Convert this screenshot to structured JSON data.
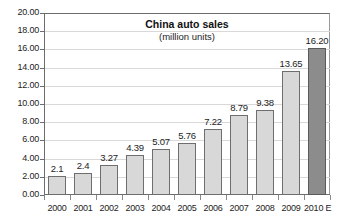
{
  "chart_data": {
    "type": "bar",
    "title": "China auto sales",
    "subtitle": "(million units)",
    "xlabel": "",
    "ylabel": "",
    "ylim": [
      0,
      20
    ],
    "grid": true,
    "legend": "none",
    "categories": [
      "2000",
      "2001",
      "2002",
      "2003",
      "2004",
      "2005",
      "2006",
      "2007",
      "2008",
      "2009",
      "2010 E"
    ],
    "values": [
      2.1,
      2.4,
      3.27,
      4.39,
      5.07,
      5.76,
      7.22,
      8.79,
      9.38,
      13.65,
      16.2
    ],
    "value_labels": [
      "2.1",
      "2.4",
      "3.27",
      "4.39",
      "5.07",
      "5.76",
      "7.22",
      "8.79",
      "9.38",
      "13.65",
      "16.20"
    ],
    "ytick_labels": [
      "0.00",
      "2.00",
      "4.00",
      "6.00",
      "8.00",
      "10.00",
      "12.00",
      "14.00",
      "16.00",
      "18.00",
      "20.00"
    ],
    "ytick_values": [
      0,
      2,
      4,
      6,
      8,
      10,
      12,
      14,
      16,
      18,
      20
    ],
    "highlight_index": 10,
    "colors": {
      "bar_fill": "#d8d8d8",
      "bar_border": "#6e6e6e",
      "highlight_fill": "#8c8c8c",
      "highlight_border": "#5a5a5a",
      "grid": "#d9d9d9",
      "axis": "#6d6d6d",
      "text": "#1d1d1d",
      "background": "#ffffff"
    }
  }
}
